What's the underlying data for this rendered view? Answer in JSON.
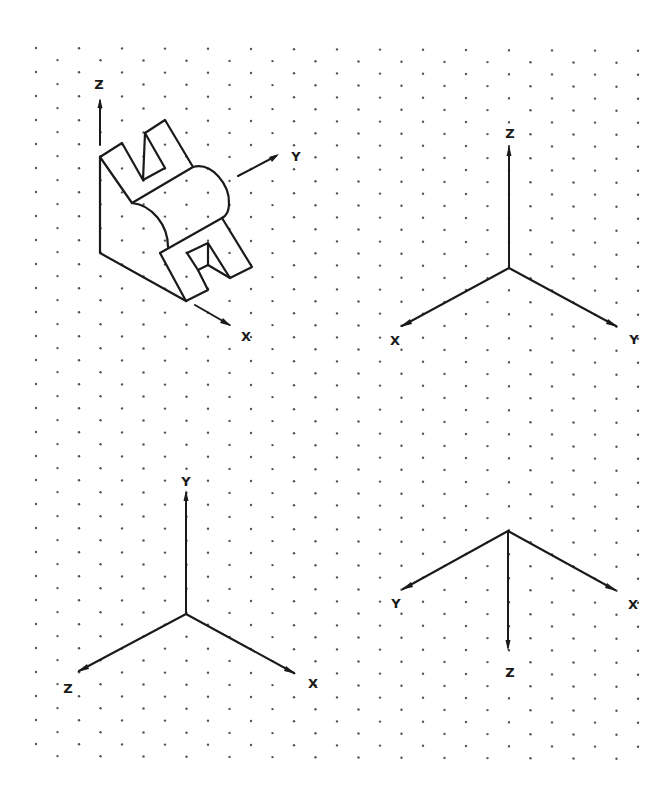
{
  "figure": {
    "background": "#ffffff",
    "ink": "#1a1a1a",
    "grid": {
      "type": "isometric-dot-grid",
      "columns": 29,
      "rows": 30,
      "x0": 36,
      "dx": 21.5,
      "y0_even": 48,
      "y0_odd": 60,
      "dy": 24,
      "dot_color": "#555555"
    },
    "object_view": {
      "title": "isometric object with reference axes",
      "axes": {
        "z_label": "Z",
        "y_label": "Y",
        "x_label": "X"
      }
    },
    "axes_sets": [
      {
        "name": "top-right-axes",
        "up_label": "Z",
        "left_label": "X",
        "right_label": "Y"
      },
      {
        "name": "bottom-left-axes",
        "up_label": "Y",
        "left_label": "Z",
        "right_label": "X"
      },
      {
        "name": "bottom-right-axes",
        "left_label": "Y",
        "right_label": "X",
        "down_label": "Z"
      }
    ]
  }
}
